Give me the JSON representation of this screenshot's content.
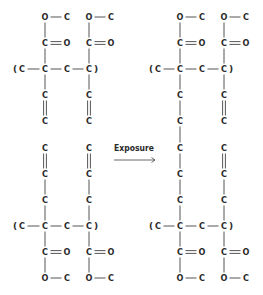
{
  "diagram": {
    "arrow_label": "Exposure",
    "atom_color": "#2a2a2a",
    "bond_color": "#555555",
    "before": {
      "name": "before-exposure",
      "description": "Two separate polymer chains, each with ester side groups and pendant vinyl (C=C) groups",
      "top_chain": {
        "backbone": [
          "(",
          "C",
          "C",
          "C",
          "C",
          ")"
        ],
        "side_groups": [
          {
            "carbonyl": [
              "C",
              "O"
            ],
            "ester": [
              "O",
              "C"
            ],
            "pendant": [
              "C",
              "C"
            ],
            "pendant_bond": "double"
          },
          {
            "carbonyl": [
              "C",
              "O"
            ],
            "ester": [
              "O",
              "C"
            ],
            "pendant": [
              "C",
              "C"
            ],
            "pendant_bond": "double"
          }
        ],
        "dangling": [
          "C",
          "C"
        ]
      },
      "bottom_chain": {
        "backbone": [
          "(",
          "C",
          "C",
          "C",
          "C",
          ")"
        ],
        "side_groups": [
          {
            "carbonyl": [
              "C",
              "O"
            ],
            "ester": [
              "O",
              "C"
            ],
            "pendant": [
              "C",
              "C",
              "C"
            ],
            "pendant_bonds": [
              "double",
              "single",
              "single"
            ]
          },
          {
            "carbonyl": [
              "C",
              "O"
            ],
            "ester": [
              "O",
              "C"
            ],
            "pendant": [
              "C",
              "C",
              "C"
            ],
            "pendant_bonds": [
              "double",
              "single",
              "single"
            ]
          }
        ]
      }
    },
    "after": {
      "name": "after-exposure",
      "description": "Chains crosslinked via a single-bonded carbon bridge on the left column; right column retains C=C groups",
      "left_column": [
        "C",
        "C",
        "C",
        "C",
        "C",
        "C",
        "C"
      ],
      "right_column_top": [
        "C",
        "C"
      ],
      "right_column_bottom": [
        "C",
        "C",
        "C"
      ]
    }
  },
  "atoms": [
    {
      "id": "bl-o1",
      "t": "O",
      "x": 45,
      "y": 17
    },
    {
      "id": "bl-c1",
      "t": "C",
      "x": 67,
      "y": 17
    },
    {
      "id": "bl-o2",
      "t": "O",
      "x": 89,
      "y": 17
    },
    {
      "id": "bl-c2",
      "t": "C",
      "x": 111,
      "y": 17
    },
    {
      "id": "bl-c3",
      "t": "C",
      "x": 45,
      "y": 43
    },
    {
      "id": "bl-o3",
      "t": "O",
      "x": 67,
      "y": 43
    },
    {
      "id": "bl-c4",
      "t": "C",
      "x": 89,
      "y": 43
    },
    {
      "id": "bl-o4",
      "t": "O",
      "x": 111,
      "y": 43
    },
    {
      "id": "bl-c5",
      "t": "C",
      "x": 22,
      "y": 69
    },
    {
      "id": "bl-c6",
      "t": "C",
      "x": 45,
      "y": 69
    },
    {
      "id": "bl-c7",
      "t": "C",
      "x": 67,
      "y": 69
    },
    {
      "id": "bl-c8",
      "t": "C",
      "x": 89,
      "y": 69
    },
    {
      "id": "bl-c9",
      "t": "C",
      "x": 45,
      "y": 95
    },
    {
      "id": "bl-c10",
      "t": "C",
      "x": 89,
      "y": 95
    },
    {
      "id": "bl-c11",
      "t": "C",
      "x": 45,
      "y": 121
    },
    {
      "id": "bl-c12",
      "t": "C",
      "x": 89,
      "y": 121
    },
    {
      "id": "bl-c13",
      "t": "C",
      "x": 45,
      "y": 148
    },
    {
      "id": "bl-c14",
      "t": "C",
      "x": 89,
      "y": 148
    },
    {
      "id": "bl-c15",
      "t": "C",
      "x": 45,
      "y": 174
    },
    {
      "id": "bl-c16",
      "t": "C",
      "x": 89,
      "y": 174
    },
    {
      "id": "bl-c17",
      "t": "C",
      "x": 45,
      "y": 200
    },
    {
      "id": "bl-c18",
      "t": "C",
      "x": 89,
      "y": 200
    },
    {
      "id": "bl-c19",
      "t": "C",
      "x": 22,
      "y": 226
    },
    {
      "id": "bl-c20",
      "t": "C",
      "x": 45,
      "y": 226
    },
    {
      "id": "bl-c21",
      "t": "C",
      "x": 67,
      "y": 226
    },
    {
      "id": "bl-c22",
      "t": "C",
      "x": 89,
      "y": 226
    },
    {
      "id": "bl-c23",
      "t": "C",
      "x": 45,
      "y": 252
    },
    {
      "id": "bl-o5",
      "t": "O",
      "x": 67,
      "y": 252
    },
    {
      "id": "bl-c24",
      "t": "C",
      "x": 89,
      "y": 252
    },
    {
      "id": "bl-o6",
      "t": "O",
      "x": 111,
      "y": 252
    },
    {
      "id": "bl-o7",
      "t": "O",
      "x": 45,
      "y": 278
    },
    {
      "id": "bl-c25",
      "t": "C",
      "x": 67,
      "y": 278
    },
    {
      "id": "bl-o8",
      "t": "O",
      "x": 89,
      "y": 278
    },
    {
      "id": "bl-c26",
      "t": "C",
      "x": 111,
      "y": 278
    },
    {
      "id": "ar-o1",
      "t": "O",
      "x": 180,
      "y": 17
    },
    {
      "id": "ar-c1",
      "t": "C",
      "x": 202,
      "y": 17
    },
    {
      "id": "ar-o2",
      "t": "O",
      "x": 224,
      "y": 17
    },
    {
      "id": "ar-c2",
      "t": "C",
      "x": 246,
      "y": 17
    },
    {
      "id": "ar-c3",
      "t": "C",
      "x": 180,
      "y": 43
    },
    {
      "id": "ar-o3",
      "t": "O",
      "x": 202,
      "y": 43
    },
    {
      "id": "ar-c4",
      "t": "C",
      "x": 224,
      "y": 43
    },
    {
      "id": "ar-o4",
      "t": "O",
      "x": 246,
      "y": 43
    },
    {
      "id": "ar-c5",
      "t": "C",
      "x": 158,
      "y": 69
    },
    {
      "id": "ar-c6",
      "t": "C",
      "x": 180,
      "y": 69
    },
    {
      "id": "ar-c7",
      "t": "C",
      "x": 202,
      "y": 69
    },
    {
      "id": "ar-c8",
      "t": "C",
      "x": 224,
      "y": 69
    },
    {
      "id": "ar-c9",
      "t": "C",
      "x": 180,
      "y": 95
    },
    {
      "id": "ar-c10",
      "t": "C",
      "x": 224,
      "y": 95
    },
    {
      "id": "ar-c11",
      "t": "C",
      "x": 180,
      "y": 121
    },
    {
      "id": "ar-c12",
      "t": "C",
      "x": 224,
      "y": 121
    },
    {
      "id": "ar-c13",
      "t": "C",
      "x": 180,
      "y": 148
    },
    {
      "id": "ar-c14",
      "t": "C",
      "x": 224,
      "y": 148
    },
    {
      "id": "ar-c15",
      "t": "C",
      "x": 180,
      "y": 174
    },
    {
      "id": "ar-c16",
      "t": "C",
      "x": 224,
      "y": 174
    },
    {
      "id": "ar-c17",
      "t": "C",
      "x": 180,
      "y": 200
    },
    {
      "id": "ar-c18",
      "t": "C",
      "x": 224,
      "y": 200
    },
    {
      "id": "ar-c19",
      "t": "C",
      "x": 158,
      "y": 226
    },
    {
      "id": "ar-c20",
      "t": "C",
      "x": 180,
      "y": 226
    },
    {
      "id": "ar-c21",
      "t": "C",
      "x": 202,
      "y": 226
    },
    {
      "id": "ar-c22",
      "t": "C",
      "x": 224,
      "y": 226
    },
    {
      "id": "ar-c23",
      "t": "C",
      "x": 180,
      "y": 252
    },
    {
      "id": "ar-o5",
      "t": "O",
      "x": 202,
      "y": 252
    },
    {
      "id": "ar-c24",
      "t": "C",
      "x": 224,
      "y": 252
    },
    {
      "id": "ar-o6",
      "t": "O",
      "x": 246,
      "y": 252
    },
    {
      "id": "ar-o7",
      "t": "O",
      "x": 180,
      "y": 278
    },
    {
      "id": "ar-c25",
      "t": "C",
      "x": 202,
      "y": 278
    },
    {
      "id": "ar-o8",
      "t": "O",
      "x": 224,
      "y": 278
    },
    {
      "id": "ar-c26",
      "t": "C",
      "x": 246,
      "y": 278
    }
  ],
  "parens": [
    {
      "id": "bl-p1",
      "t": "(",
      "x": 15,
      "y": 69
    },
    {
      "id": "bl-p2",
      "t": ")",
      "x": 96,
      "y": 69
    },
    {
      "id": "bl-p3",
      "t": "(",
      "x": 15,
      "y": 226
    },
    {
      "id": "bl-p4",
      "t": ")",
      "x": 96,
      "y": 226
    },
    {
      "id": "ar-p1",
      "t": "(",
      "x": 151,
      "y": 69
    },
    {
      "id": "ar-p2",
      "t": ")",
      "x": 231,
      "y": 69
    },
    {
      "id": "ar-p3",
      "t": "(",
      "x": 151,
      "y": 226
    },
    {
      "id": "ar-p4",
      "t": ")",
      "x": 231,
      "y": 226
    }
  ],
  "bonds": [
    {
      "a": "bl-o1",
      "b": "bl-c1",
      "o": 1
    },
    {
      "a": "bl-o2",
      "b": "bl-c2",
      "o": 1
    },
    {
      "a": "bl-o1",
      "b": "bl-c3",
      "o": 1
    },
    {
      "a": "bl-o2",
      "b": "bl-c4",
      "o": 1
    },
    {
      "a": "bl-c3",
      "b": "bl-o3",
      "o": 2
    },
    {
      "a": "bl-c4",
      "b": "bl-o4",
      "o": 2
    },
    {
      "a": "bl-c3",
      "b": "bl-c6",
      "o": 1
    },
    {
      "a": "bl-c4",
      "b": "bl-c8",
      "o": 1
    },
    {
      "a": "bl-c5",
      "b": "bl-c6",
      "o": 1
    },
    {
      "a": "bl-c6",
      "b": "bl-c7",
      "o": 1
    },
    {
      "a": "bl-c7",
      "b": "bl-c8",
      "o": 1
    },
    {
      "a": "bl-c6",
      "b": "bl-c9",
      "o": 1
    },
    {
      "a": "bl-c8",
      "b": "bl-c10",
      "o": 1
    },
    {
      "a": "bl-c9",
      "b": "bl-c11",
      "o": 2
    },
    {
      "a": "bl-c10",
      "b": "bl-c12",
      "o": 2
    },
    {
      "a": "bl-c13",
      "b": "bl-c15",
      "o": 2
    },
    {
      "a": "bl-c14",
      "b": "bl-c16",
      "o": 2
    },
    {
      "a": "bl-c15",
      "b": "bl-c17",
      "o": 1
    },
    {
      "a": "bl-c16",
      "b": "bl-c18",
      "o": 1
    },
    {
      "a": "bl-c17",
      "b": "bl-c20",
      "o": 1
    },
    {
      "a": "bl-c18",
      "b": "bl-c22",
      "o": 1
    },
    {
      "a": "bl-c19",
      "b": "bl-c20",
      "o": 1
    },
    {
      "a": "bl-c20",
      "b": "bl-c21",
      "o": 1
    },
    {
      "a": "bl-c21",
      "b": "bl-c22",
      "o": 1
    },
    {
      "a": "bl-c20",
      "b": "bl-c23",
      "o": 1
    },
    {
      "a": "bl-c22",
      "b": "bl-c24",
      "o": 1
    },
    {
      "a": "bl-c23",
      "b": "bl-o5",
      "o": 2
    },
    {
      "a": "bl-c24",
      "b": "bl-o6",
      "o": 2
    },
    {
      "a": "bl-c23",
      "b": "bl-o7",
      "o": 1
    },
    {
      "a": "bl-c24",
      "b": "bl-o8",
      "o": 1
    },
    {
      "a": "bl-o7",
      "b": "bl-c25",
      "o": 1
    },
    {
      "a": "bl-o8",
      "b": "bl-c26",
      "o": 1
    },
    {
      "a": "ar-o1",
      "b": "ar-c1",
      "o": 1
    },
    {
      "a": "ar-o2",
      "b": "ar-c2",
      "o": 1
    },
    {
      "a": "ar-o1",
      "b": "ar-c3",
      "o": 1
    },
    {
      "a": "ar-o2",
      "b": "ar-c4",
      "o": 1
    },
    {
      "a": "ar-c3",
      "b": "ar-o3",
      "o": 2
    },
    {
      "a": "ar-c4",
      "b": "ar-o4",
      "o": 2
    },
    {
      "a": "ar-c3",
      "b": "ar-c6",
      "o": 1
    },
    {
      "a": "ar-c4",
      "b": "ar-c8",
      "o": 1
    },
    {
      "a": "ar-c5",
      "b": "ar-c6",
      "o": 1
    },
    {
      "a": "ar-c6",
      "b": "ar-c7",
      "o": 1
    },
    {
      "a": "ar-c7",
      "b": "ar-c8",
      "o": 1
    },
    {
      "a": "ar-c6",
      "b": "ar-c9",
      "o": 1
    },
    {
      "a": "ar-c8",
      "b": "ar-c10",
      "o": 1
    },
    {
      "a": "ar-c9",
      "b": "ar-c11",
      "o": 1
    },
    {
      "a": "ar-c10",
      "b": "ar-c12",
      "o": 2
    },
    {
      "a": "ar-c11",
      "b": "ar-c13",
      "o": 1
    },
    {
      "a": "ar-c13",
      "b": "ar-c15",
      "o": 1
    },
    {
      "a": "ar-c14",
      "b": "ar-c16",
      "o": 2
    },
    {
      "a": "ar-c15",
      "b": "ar-c17",
      "o": 1
    },
    {
      "a": "ar-c16",
      "b": "ar-c18",
      "o": 1
    },
    {
      "a": "ar-c17",
      "b": "ar-c20",
      "o": 1
    },
    {
      "a": "ar-c18",
      "b": "ar-c22",
      "o": 1
    },
    {
      "a": "ar-c19",
      "b": "ar-c20",
      "o": 1
    },
    {
      "a": "ar-c20",
      "b": "ar-c21",
      "o": 1
    },
    {
      "a": "ar-c21",
      "b": "ar-c22",
      "o": 1
    },
    {
      "a": "ar-c20",
      "b": "ar-c23",
      "o": 1
    },
    {
      "a": "ar-c22",
      "b": "ar-c24",
      "o": 1
    },
    {
      "a": "ar-c23",
      "b": "ar-o5",
      "o": 2
    },
    {
      "a": "ar-c24",
      "b": "ar-o6",
      "o": 2
    },
    {
      "a": "ar-c23",
      "b": "ar-o7",
      "o": 1
    },
    {
      "a": "ar-c24",
      "b": "ar-o8",
      "o": 1
    },
    {
      "a": "ar-o7",
      "b": "ar-c25",
      "o": 1
    },
    {
      "a": "ar-o8",
      "b": "ar-c26",
      "o": 1
    }
  ]
}
